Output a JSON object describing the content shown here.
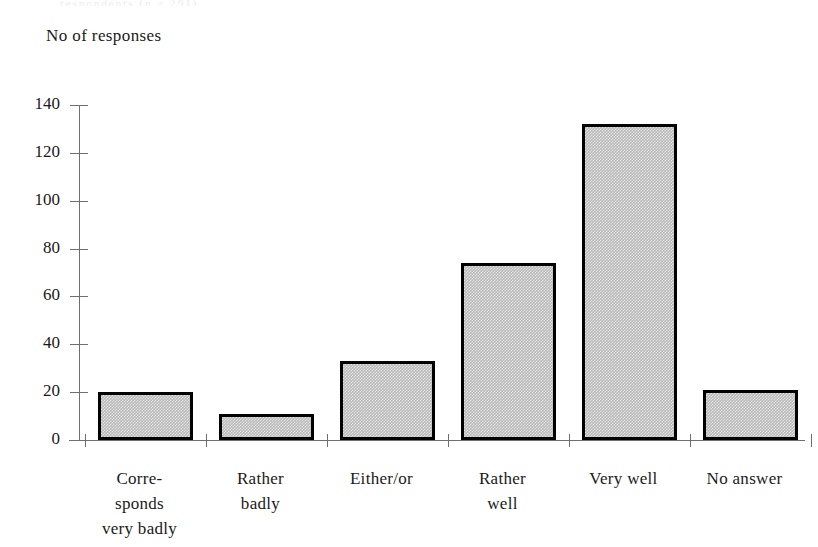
{
  "figure": {
    "top_artifact_text": "respondents (n = 291)",
    "axis_title": "No of\nresponses"
  },
  "chart_data": {
    "type": "bar",
    "title": "",
    "subtitle": "",
    "xlabel": "",
    "ylabel": "No of responses",
    "ylim": [
      0,
      140
    ],
    "ytick_step": 20,
    "grid": false,
    "legend": "none",
    "categories": [
      "Corre-\nsponds\nvery badly",
      "Rather\nbadly",
      "Either/or",
      "Rather\nwell",
      "Very well",
      "No answer"
    ],
    "category_labels_flat": [
      "Corre-sponds very badly",
      "Rather badly",
      "Either/or",
      "Rather well",
      "Very well",
      "No answer"
    ],
    "values": [
      20,
      11,
      33,
      74,
      132,
      21
    ],
    "ytick_labels": [
      "0",
      "20",
      "40",
      "60",
      "80",
      "100",
      "120",
      "140"
    ],
    "ytick_values": [
      0,
      20,
      40,
      60,
      80,
      100,
      120,
      140
    ],
    "bar_fill_color": "#b9b9b9",
    "bar_edge_color": "#000000",
    "axis_color": "#6f6f6f"
  }
}
